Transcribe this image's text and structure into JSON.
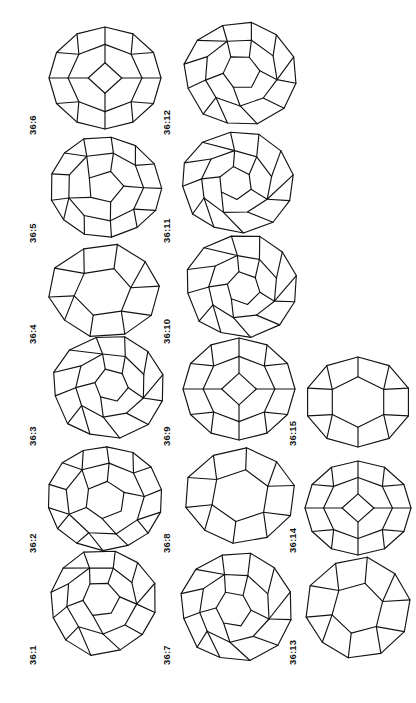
{
  "figure": {
    "kind": "polyhedra-plate",
    "orientation_degrees": -90,
    "background_color": "#ffffff",
    "stroke_color": "#131313",
    "stroke_width": 1.15,
    "columns": 3,
    "rows": 6,
    "label_prefix": "36",
    "label_separator": ":"
  },
  "items": [
    {
      "id": "item-1",
      "label": "36:1",
      "col": 0,
      "row": 0,
      "x": 44,
      "y": 546,
      "w": 122,
      "h": 118,
      "caption_x": 27,
      "caption_y": 665,
      "shape": "truncated-cage-a"
    },
    {
      "id": "item-2",
      "label": "36:2",
      "col": 0,
      "row": 1,
      "x": 44,
      "y": 440,
      "w": 122,
      "h": 112,
      "caption_x": 27,
      "caption_y": 553,
      "shape": "barrel-cage-b"
    },
    {
      "id": "item-3",
      "label": "36:3",
      "col": 0,
      "row": 2,
      "x": 44,
      "y": 333,
      "w": 122,
      "h": 112,
      "caption_x": 27,
      "caption_y": 446,
      "shape": "tilted-cage-c"
    },
    {
      "id": "item-4",
      "label": "36:4",
      "col": 0,
      "row": 3,
      "x": 44,
      "y": 238,
      "w": 122,
      "h": 104,
      "caption_x": 27,
      "caption_y": 344,
      "shape": "plain-cage-d"
    },
    {
      "id": "item-5",
      "label": "36:5",
      "col": 0,
      "row": 4,
      "x": 44,
      "y": 132,
      "w": 122,
      "h": 110,
      "caption_x": 27,
      "caption_y": 243,
      "shape": "round-cage-e"
    },
    {
      "id": "item-6",
      "label": "36:6",
      "col": 0,
      "row": 5,
      "x": 44,
      "y": 22,
      "w": 122,
      "h": 112,
      "caption_x": 27,
      "caption_y": 135,
      "shape": "symmetric-cage-f"
    },
    {
      "id": "item-7",
      "label": "36:7",
      "col": 1,
      "row": 0,
      "x": 178,
      "y": 546,
      "w": 122,
      "h": 118,
      "caption_x": 161,
      "caption_y": 665,
      "shape": "tilted-cage-g"
    },
    {
      "id": "item-8",
      "label": "36:8",
      "col": 1,
      "row": 1,
      "x": 178,
      "y": 444,
      "w": 122,
      "h": 106,
      "caption_x": 161,
      "caption_y": 553,
      "shape": "plain-cage-h"
    },
    {
      "id": "item-9",
      "label": "36:9",
      "col": 1,
      "row": 2,
      "x": 178,
      "y": 333,
      "w": 122,
      "h": 112,
      "caption_x": 161,
      "caption_y": 446,
      "shape": "symmetric-cage-i"
    },
    {
      "id": "item-10",
      "label": "36:10",
      "col": 1,
      "row": 3,
      "x": 178,
      "y": 228,
      "w": 122,
      "h": 112,
      "caption_x": 161,
      "caption_y": 344,
      "shape": "tilted-cage-j"
    },
    {
      "id": "item-11",
      "label": "36:11",
      "col": 1,
      "row": 4,
      "x": 178,
      "y": 126,
      "w": 122,
      "h": 110,
      "caption_x": 161,
      "caption_y": 243,
      "shape": "tilted-cage-k"
    },
    {
      "id": "item-12",
      "label": "36:12",
      "col": 1,
      "row": 5,
      "x": 178,
      "y": 20,
      "w": 122,
      "h": 112,
      "caption_x": 161,
      "caption_y": 135,
      "shape": "tilted-cage-l"
    },
    {
      "id": "item-13",
      "label": "36:13",
      "col": 2,
      "row": 0,
      "x": 300,
      "y": 552,
      "w": 116,
      "h": 112,
      "caption_x": 287,
      "caption_y": 665,
      "shape": "plain-cage-m"
    },
    {
      "id": "item-14",
      "label": "36:14",
      "col": 2,
      "row": 1,
      "x": 300,
      "y": 456,
      "w": 116,
      "h": 104,
      "caption_x": 287,
      "caption_y": 553,
      "shape": "symmetric-cage-n"
    },
    {
      "id": "item-15",
      "label": "36:15",
      "col": 2,
      "row": 2,
      "x": 300,
      "y": 352,
      "w": 116,
      "h": 100,
      "caption_x": 287,
      "caption_y": 446,
      "shape": "dodecahedral-cage-o"
    }
  ]
}
